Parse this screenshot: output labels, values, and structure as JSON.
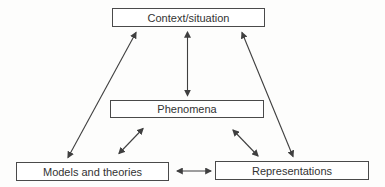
{
  "diagram": {
    "title": "",
    "background_color": "#fdfdfc",
    "box_fill_color": "#ffffff",
    "box_border_color": "#4a4a4a",
    "line_color": "#3f3f3f",
    "text_color": "#333333",
    "nodes": [
      {
        "id": "context",
        "label": "Context/situation"
      },
      {
        "id": "phenomena",
        "label": "Phenomena"
      },
      {
        "id": "models",
        "label": "Models and theories"
      },
      {
        "id": "representations",
        "label": "Representations"
      }
    ],
    "edges": [
      {
        "from": "context",
        "to": "phenomena",
        "bidirectional": true
      },
      {
        "from": "context",
        "to": "models",
        "bidirectional": true
      },
      {
        "from": "context",
        "to": "representations",
        "bidirectional": true
      },
      {
        "from": "phenomena",
        "to": "models",
        "bidirectional": true
      },
      {
        "from": "phenomena",
        "to": "representations",
        "bidirectional": true
      },
      {
        "from": "models",
        "to": "representations",
        "bidirectional": true
      }
    ]
  }
}
